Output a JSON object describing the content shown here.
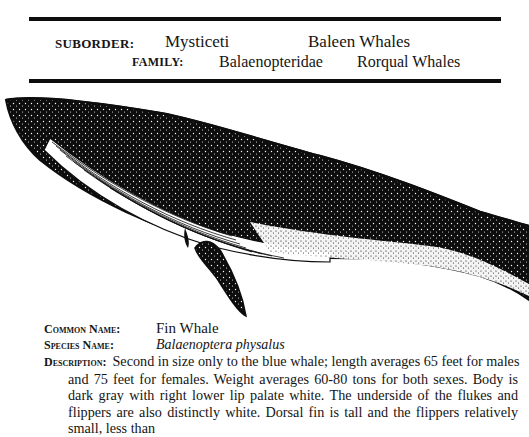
{
  "header": {
    "suborder_label": "SUBORDER:",
    "suborder_value": "Mysticeti",
    "suborder_common": "Baleen Whales",
    "family_label": "FAMILY:",
    "family_value": "Balaenopteridae",
    "family_common": "Rorqual Whales"
  },
  "illustration": {
    "subject": "Fin whale stippled ink drawing (head, throat pleats, flipper)",
    "colors": {
      "ink": "#0d0d0d",
      "paper": "#ffffff"
    }
  },
  "entry": {
    "common_name_label": "Common Name:",
    "common_name": "Fin Whale",
    "species_name_label": "Species Name:",
    "species_name": "Balaenoptera physalus",
    "description_label": "Description:",
    "description_first_line": "Second in size only to the blue whale; length averages 65 feet for males",
    "description_rest": "and 75 feet for females. Weight averages 60-80 tons for both sexes. Body is dark gray with right lower lip palate white. The underside of the flukes and flippers are also distinctly white. Dorsal fin is tall and the flippers relatively small, less than"
  }
}
